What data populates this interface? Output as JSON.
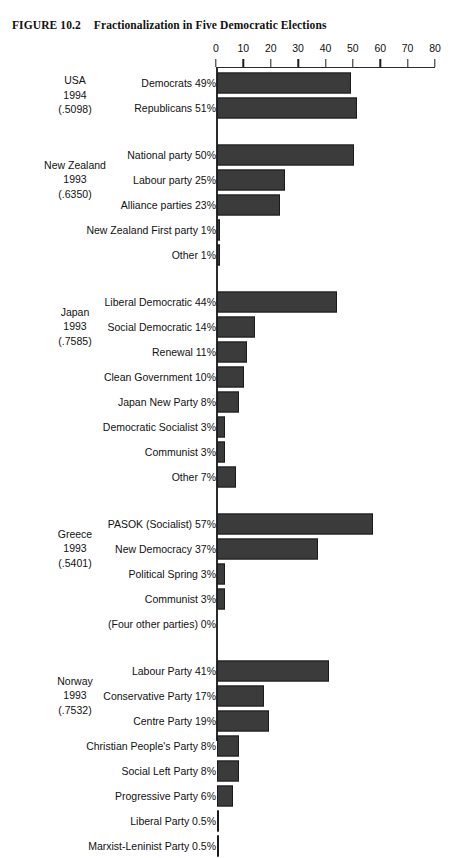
{
  "title": {
    "figure_number": "FIGURE 10.2",
    "caption": "Fractionalization in Five Democratic Elections"
  },
  "chart_data": {
    "type": "bar",
    "orientation": "horizontal",
    "title": "Fractionalization in Five Democratic Elections",
    "xlabel": "",
    "ylabel": "",
    "xlim": [
      0,
      80
    ],
    "xticks": [
      0,
      10,
      20,
      30,
      40,
      50,
      60,
      70,
      80
    ],
    "tick_labels": [
      "0",
      "10",
      "20",
      "30",
      "40",
      "50",
      "60",
      "70",
      "80"
    ],
    "grid": false,
    "legend": "none",
    "axis_position": "top",
    "value_unit": "percent",
    "bar_color": "#3b3b3b",
    "groups": [
      {
        "country": "USA",
        "year": "1994",
        "fractionalization": "(.5098)",
        "categories": [
          "Democrats 49%",
          "Republicans 51%"
        ],
        "labels": [
          "Democrats",
          "Republicans"
        ],
        "values": [
          49,
          51
        ]
      },
      {
        "country": "New Zealand",
        "year": "1993",
        "fractionalization": "(.6350)",
        "categories": [
          "National party 50%",
          "Labour party 25%",
          "Alliance parties 23%",
          "New Zealand First party 1%",
          "Other 1%"
        ],
        "labels": [
          "National party",
          "Labour party",
          "Alliance parties",
          "New Zealand First party",
          "Other"
        ],
        "values": [
          50,
          25,
          23,
          1,
          1
        ]
      },
      {
        "country": "Japan",
        "year": "1993",
        "fractionalization": "(.7585)",
        "categories": [
          "Liberal Democratic 44%",
          "Social Democratic 14%",
          "Renewal 11%",
          "Clean Government 10%",
          "Japan New Party 8%",
          "Democratic Socialist 3%",
          "Communist 3%",
          "Other 7%"
        ],
        "labels": [
          "Liberal Democratic",
          "Social Democratic",
          "Renewal",
          "Clean Government",
          "Japan New Party",
          "Democratic Socialist",
          "Communist",
          "Other"
        ],
        "values": [
          44,
          14,
          11,
          10,
          8,
          3,
          3,
          7
        ]
      },
      {
        "country": "Greece",
        "year": "1993",
        "fractionalization": "(.5401)",
        "categories": [
          "PASOK (Socialist) 57%",
          "New Democracy 37%",
          "Political Spring 3%",
          "Communist 3%",
          "(Four other parties) 0%"
        ],
        "labels": [
          "PASOK (Socialist)",
          "New Democracy",
          "Political Spring",
          "Communist",
          "(Four other parties)"
        ],
        "values": [
          57,
          37,
          3,
          3,
          0
        ]
      },
      {
        "country": "Norway",
        "year": "1993",
        "fractionalization": "(.7532)",
        "categories": [
          "Labour Party 41%",
          "Conservative Party 17%",
          "Centre Party 19%",
          "Christian People's Party 8%",
          "Social Left Party 8%",
          "Progressive Party 6%",
          "Liberal Party 0.5%",
          "Marxist-Leninist Party 0.5%"
        ],
        "labels": [
          "Labour Party",
          "Conservative Party",
          "Centre Party",
          "Christian People's Party",
          "Social Left Party",
          "Progressive Party",
          "Liberal Party",
          "Marxist-Leninist Party"
        ],
        "values": [
          41,
          17,
          19,
          8,
          8,
          6,
          0.5,
          0.5
        ]
      }
    ]
  }
}
